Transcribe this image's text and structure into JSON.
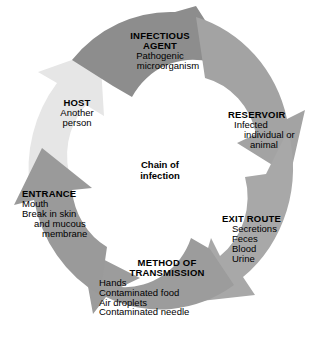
{
  "diagram": {
    "title": "Chain of infection",
    "type": "circular-cycle",
    "center_label_line1": "Chain of",
    "center_label_line2": "infection",
    "background_color": "#ffffff",
    "text_color": "#000000",
    "segments": [
      {
        "id": "infectious-agent",
        "title": "INFECTIOUS",
        "title_line2": "AGENT",
        "items": [
          "Pathogenic",
          "microorganism"
        ],
        "color": "#8d8d8d",
        "order": 1
      },
      {
        "id": "reservoir",
        "title": "RESERVOIR",
        "items": [
          "Infected",
          "individual or",
          "animal"
        ],
        "color": "#a3a3a3",
        "order": 2
      },
      {
        "id": "exit-route",
        "title": "EXIT ROUTE",
        "items": [
          "Secretions",
          "Feces",
          "Blood",
          "Urine"
        ],
        "color": "#a8a8a8",
        "order": 3
      },
      {
        "id": "method-of-transmission",
        "title": "METHOD OF",
        "title_line2": "TRANSMISSION",
        "items": [
          "Hands",
          "Contaminated food",
          "Air droplets",
          "Contaminated needle"
        ],
        "color": "#9c9c9c",
        "order": 4
      },
      {
        "id": "entrance",
        "title": "ENTRANCE",
        "items": [
          "Mouth",
          "Break in skin",
          "and mucous",
          "membrane"
        ],
        "color": "#9a9a9a",
        "order": 5
      },
      {
        "id": "host",
        "title": "HOST",
        "items": [
          "Another",
          "person"
        ],
        "color": "#e6e6e6",
        "order": 6
      }
    ]
  }
}
